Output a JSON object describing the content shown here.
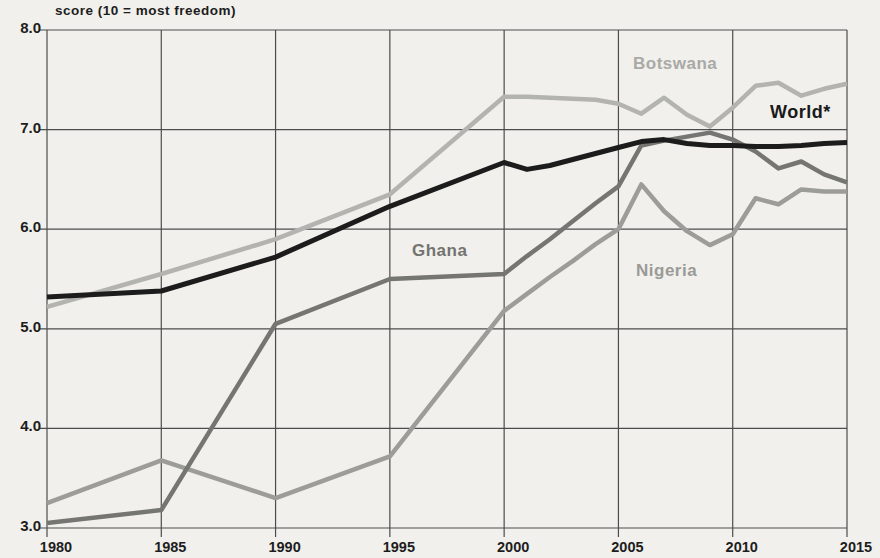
{
  "chart_data": {
    "type": "line",
    "title": "score (10 = most freedom)",
    "xlabel": "",
    "ylabel": "score (10 = most freedom)",
    "xlim": [
      1980,
      2015
    ],
    "ylim": [
      3.0,
      8.0
    ],
    "grid": true,
    "legend_position": "inline-labels-on-lines",
    "x_ticks": [
      1980,
      1985,
      1990,
      1995,
      2000,
      2005,
      2010,
      2015
    ],
    "x_tick_labels": [
      "1980",
      "1985",
      "1990",
      "1995",
      "2000",
      "2005",
      "2010",
      "2015"
    ],
    "y_ticks": [
      8.0,
      7.0,
      6.0,
      5.0,
      4.0,
      3.0
    ],
    "y_tick_labels": [
      "8.0",
      "7.0",
      "6.0",
      "5.0",
      "4.0",
      "3.0"
    ],
    "x": [
      1980,
      1985,
      1990,
      1995,
      2000,
      2001,
      2002,
      2003,
      2004,
      2005,
      2006,
      2007,
      2008,
      2009,
      2010,
      2011,
      2012,
      2013,
      2014,
      2015
    ],
    "series": [
      {
        "name": "Botswana",
        "color": "#b3b3b0",
        "line_width": 4.5,
        "values": [
          5.22,
          5.55,
          5.9,
          6.35,
          7.33,
          7.33,
          7.32,
          7.31,
          7.3,
          7.26,
          7.16,
          7.32,
          7.15,
          7.03,
          7.22,
          7.44,
          7.47,
          7.34,
          7.41,
          7.46
        ]
      },
      {
        "name": "Nigeria",
        "color": "#9c9c99",
        "line_width": 4.5,
        "values": [
          3.25,
          3.68,
          3.3,
          3.72,
          5.18,
          5.35,
          5.52,
          5.68,
          5.85,
          6.0,
          6.45,
          6.18,
          5.98,
          5.84,
          5.95,
          6.31,
          6.25,
          6.4,
          6.38,
          6.38
        ]
      },
      {
        "name": "Ghana",
        "color": "#757572",
        "line_width": 4.5,
        "values": [
          3.05,
          3.18,
          5.05,
          5.5,
          5.55,
          5.73,
          5.9,
          6.08,
          6.26,
          6.43,
          6.84,
          6.89,
          6.93,
          6.97,
          6.9,
          6.78,
          6.61,
          6.68,
          6.55,
          6.47
        ]
      },
      {
        "name": "World*",
        "color": "#1c1c1c",
        "line_width": 5,
        "values": [
          5.32,
          5.38,
          5.72,
          6.23,
          6.67,
          6.6,
          6.64,
          6.7,
          6.76,
          6.82,
          6.88,
          6.9,
          6.86,
          6.84,
          6.84,
          6.83,
          6.83,
          6.84,
          6.86,
          6.87
        ]
      }
    ],
    "annotations": [
      {
        "text": "Botswana",
        "x": 633,
        "y": 54,
        "color": "#a9a9a6",
        "font_size": 17
      },
      {
        "text": "World*",
        "x": 770,
        "y": 102,
        "color": "#1a1a1a",
        "font_size": 18
      },
      {
        "text": "Ghana",
        "x": 412,
        "y": 241,
        "color": "#737370",
        "font_size": 17
      },
      {
        "text": "Nigeria",
        "x": 636,
        "y": 261,
        "color": "#9a9a97",
        "font_size": 17
      }
    ]
  }
}
